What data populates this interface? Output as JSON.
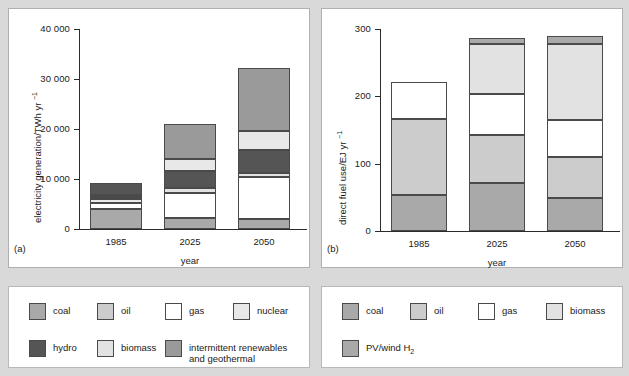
{
  "figure": {
    "background_color": "#d9d9d9",
    "panel_background": "#ffffff"
  },
  "palette": {
    "coal": "#a9a9a9",
    "oil": "#cccccc",
    "gas": "#ffffff",
    "nuclear": "#e8e8e8",
    "hydro": "#555555",
    "biomass": "#e2e2e2",
    "renewables": "#9a9a9a",
    "pv_wind_h2": "#a9a9a9",
    "axis": "#2b2b2b"
  },
  "chart_data": [
    {
      "id": "panel-a",
      "type": "bar",
      "stacked": true,
      "panel_letter": "(a)",
      "title": "",
      "xlabel": "year",
      "ylabel": "electricity generation/TWh yr",
      "ylabel_exponent": "−1",
      "categories": [
        "1985",
        "2025",
        "2050"
      ],
      "ylim": [
        0,
        40000
      ],
      "yticks": [
        0,
        10000,
        20000,
        30000,
        40000
      ],
      "ytick_labels": [
        "0",
        "10 000",
        "20 000",
        "30 000",
        "40 000"
      ],
      "grid": false,
      "legend_position": "below",
      "series": [
        {
          "name": "coal",
          "color_key": "coal",
          "values": [
            4000,
            2200,
            2000
          ]
        },
        {
          "name": "gas",
          "color_key": "gas",
          "values": [
            1300,
            5000,
            8400
          ]
        },
        {
          "name": "nuclear",
          "color_key": "nuclear",
          "values": [
            700,
            0,
            0
          ]
        },
        {
          "name": "biomass",
          "color_key": "biomass",
          "values": [
            400,
            1100,
            900
          ]
        },
        {
          "name": "intermittent renewables and geothermal",
          "color_key": "renewables",
          "values": [
            500,
            0,
            0
          ]
        },
        {
          "name": "hydro",
          "color_key": "hydro",
          "values": [
            2300,
            3400,
            4600
          ]
        },
        {
          "name": "nuclear upper",
          "color_key": "nuclear",
          "values": [
            0,
            2300,
            3800
          ]
        },
        {
          "name": "intermittent renewables upper",
          "color_key": "renewables",
          "values": [
            0,
            7000,
            12600
          ]
        }
      ],
      "totals": [
        9200,
        21000,
        32300
      ]
    },
    {
      "id": "panel-b",
      "type": "bar",
      "stacked": true,
      "panel_letter": "(b)",
      "title": "",
      "xlabel": "year",
      "ylabel": "direct fuel use/EJ yr",
      "ylabel_exponent": "−1",
      "categories": [
        "1985",
        "2025",
        "2050"
      ],
      "ylim": [
        0,
        300
      ],
      "yticks": [
        0,
        100,
        200,
        300
      ],
      "ytick_labels": [
        "0",
        "100",
        "200",
        "300"
      ],
      "grid": false,
      "legend_position": "below",
      "series": [
        {
          "name": "coal",
          "color_key": "coal",
          "values": [
            54,
            71,
            49
          ]
        },
        {
          "name": "oil",
          "color_key": "oil",
          "values": [
            113,
            72,
            61
          ]
        },
        {
          "name": "gas",
          "color_key": "gas",
          "values": [
            54,
            60,
            55
          ]
        },
        {
          "name": "biomass",
          "color_key": "biomass",
          "values": [
            0,
            75,
            113
          ]
        },
        {
          "name": "PV/wind H2",
          "color_key": "pv_wind_h2",
          "values": [
            0,
            8,
            11
          ]
        }
      ],
      "totals": [
        221,
        286,
        289
      ]
    }
  ],
  "legend_a": {
    "items": [
      {
        "label": "coal",
        "color_key": "coal"
      },
      {
        "label": "oil",
        "color_key": "oil"
      },
      {
        "label": "gas",
        "color_key": "gas"
      },
      {
        "label": "nuclear",
        "color_key": "nuclear"
      },
      {
        "label": "hydro",
        "color_key": "hydro"
      },
      {
        "label": "biomass",
        "color_key": "biomass"
      },
      {
        "label": "intermittent renewables\nand geothermal",
        "color_key": "renewables"
      }
    ]
  },
  "legend_b": {
    "items": [
      {
        "label": "coal",
        "color_key": "coal"
      },
      {
        "label": "oil",
        "color_key": "oil"
      },
      {
        "label": "gas",
        "color_key": "gas"
      },
      {
        "label": "biomass",
        "color_key": "biomass"
      },
      {
        "label": "PV/wind H",
        "sub": "2",
        "color_key": "pv_wind_h2"
      }
    ]
  }
}
